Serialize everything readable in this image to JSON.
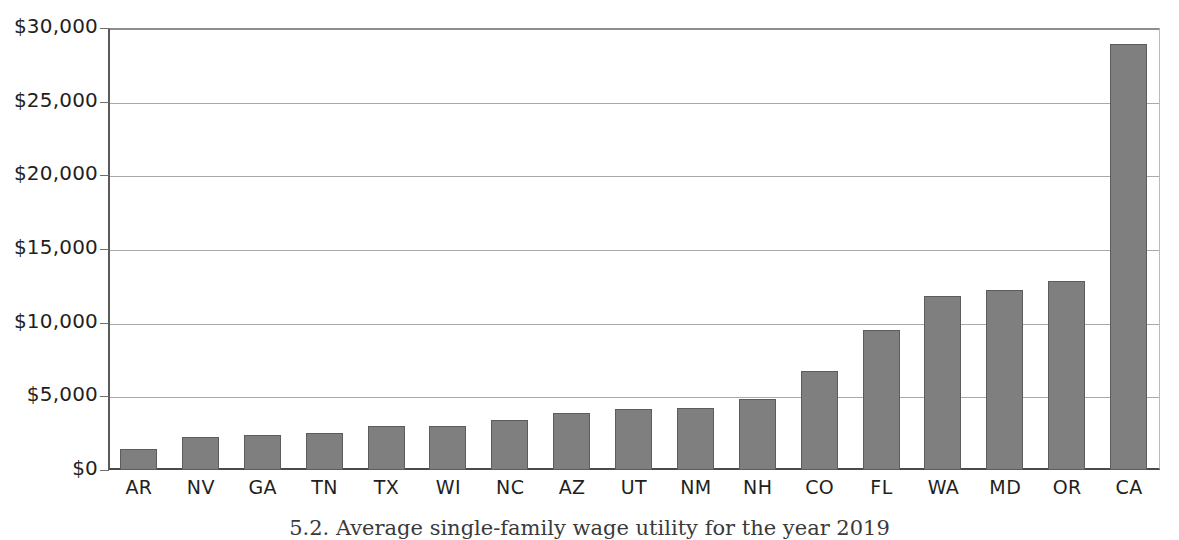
{
  "chart_data": {
    "type": "bar",
    "title": "",
    "xlabel": "",
    "ylabel": "",
    "categories": [
      "AR",
      "NV",
      "GA",
      "TN",
      "TX",
      "WI",
      "NC",
      "AZ",
      "UT",
      "NM",
      "NH",
      "CO",
      "FL",
      "WA",
      "MD",
      "OR",
      "CA"
    ],
    "values": [
      1400,
      2250,
      2400,
      2500,
      3000,
      3000,
      3400,
      3850,
      4150,
      4200,
      4850,
      6750,
      9500,
      11800,
      12250,
      12850,
      28900
    ],
    "ylim": [
      0,
      30000
    ],
    "ytick_values": [
      0,
      5000,
      10000,
      15000,
      20000,
      25000,
      30000
    ],
    "ytick_labels": [
      "$0",
      "$5,000",
      "$10,000",
      "$15,000",
      "$20,000",
      "$25,000",
      "$30,000"
    ],
    "grid": true,
    "legend": "none",
    "bar_color": "#7f7f7f",
    "bar_edge_color": "#5c5c5c",
    "gridline_color": "#a9a9a9",
    "axis_color": "#4a4a4a"
  },
  "caption": {
    "text": "5.2. Average single-family wage utility for the year 2019"
  }
}
